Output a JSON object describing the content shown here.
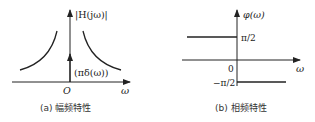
{
  "panel_a": {
    "y_label": "|H(jω)|",
    "x_label": "ω",
    "origin_label": "O",
    "impulse_label": "(πδ(ω))",
    "caption": "(a) 幅频特性"
  },
  "panel_b": {
    "y_label": "φ(ω)",
    "x_label": "ω",
    "origin_label": "0",
    "upper_level_label": "π/2",
    "lower_level_label": "−π/2",
    "caption": "(b) 相频特性"
  },
  "colors": {
    "stroke": "#222222"
  }
}
